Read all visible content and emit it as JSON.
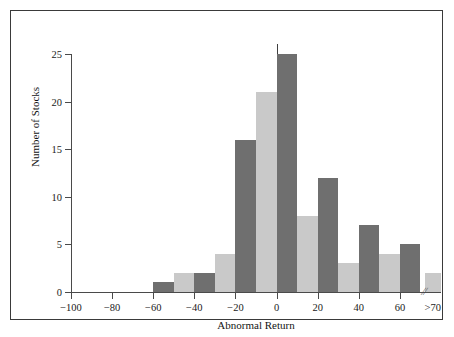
{
  "chart_data": {
    "type": "bar",
    "title": "",
    "xlabel": "Abnormal Return",
    "ylabel": "Number of Stocks",
    "xlim": [
      -100,
      80
    ],
    "ylim": [
      0,
      25
    ],
    "grid": false,
    "legend": null,
    "y_ticks": [
      0,
      5,
      10,
      15,
      20,
      25
    ],
    "y_tick_labels": [
      "0",
      "5",
      "10",
      "15",
      "20",
      "25"
    ],
    "x_ticks": [
      -100,
      -80,
      -60,
      -40,
      -20,
      0,
      20,
      40,
      60,
      70
    ],
    "x_tick_labels": [
      "−100",
      "−80",
      "−60",
      "−40",
      "−20",
      "0",
      "20",
      "40",
      "60",
      ">70"
    ],
    "axis_break_marker": "//",
    "bin_width": 10,
    "bars": [
      {
        "label": "-60 to -50",
        "x_start": -60,
        "x_end": -50,
        "value": 1,
        "shade": "dark"
      },
      {
        "label": "-50 to -40",
        "x_start": -50,
        "x_end": -40,
        "value": 2,
        "shade": "light"
      },
      {
        "label": "-40 to -30",
        "x_start": -40,
        "x_end": -30,
        "value": 2,
        "shade": "dark"
      },
      {
        "label": "-30 to -20",
        "x_start": -30,
        "x_end": -20,
        "value": 4,
        "shade": "light"
      },
      {
        "label": "-20 to -10",
        "x_start": -20,
        "x_end": -10,
        "value": 16,
        "shade": "dark"
      },
      {
        "label": "-10 to 0",
        "x_start": -10,
        "x_end": 0,
        "value": 21,
        "shade": "light"
      },
      {
        "label": "0 to 10",
        "x_start": 0,
        "x_end": 10,
        "value": 25,
        "shade": "dark"
      },
      {
        "label": "10 to 20",
        "x_start": 10,
        "x_end": 20,
        "value": 8,
        "shade": "light"
      },
      {
        "label": "20 to 30",
        "x_start": 20,
        "x_end": 30,
        "value": 12,
        "shade": "dark"
      },
      {
        "label": "30 to 40",
        "x_start": 30,
        "x_end": 40,
        "value": 3,
        "shade": "light"
      },
      {
        "label": "40 to 50",
        "x_start": 40,
        "x_end": 50,
        "value": 7,
        "shade": "dark"
      },
      {
        "label": "50 to 60",
        "x_start": 50,
        "x_end": 60,
        "value": 4,
        "shade": "light"
      },
      {
        "label": "60 to 70",
        "x_start": 60,
        "x_end": 70,
        "value": 5,
        "shade": "dark"
      },
      {
        "label": ">70",
        "x_start": 72,
        "x_end": 80,
        "value": 2,
        "shade": "light"
      }
    ],
    "colors": {
      "bar_dark": "#6f6f6f",
      "bar_light": "#c9c9c9",
      "axis": "#4a4a4a",
      "text": "#141414",
      "frame": "#3a3a3a",
      "background": "#ffffff"
    }
  }
}
